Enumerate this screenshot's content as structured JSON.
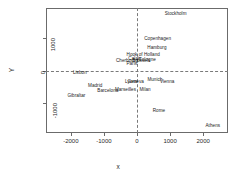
{
  "chart_data": {
    "type": "scatter",
    "title": "",
    "xlabel": "x",
    "ylabel": "Y",
    "xlim": [
      -2750,
      2750
    ],
    "ylim": [
      -1900,
      1900
    ],
    "xticks": [
      -2000,
      -1000,
      0,
      1000,
      2000
    ],
    "xticklabels": [
      "-2000",
      "-1000",
      "0",
      "1000",
      "2000"
    ],
    "yticks": [
      -1000,
      0,
      1000
    ],
    "yticklabels": [
      "-1000",
      "0",
      "1000"
    ],
    "grid": false,
    "legend": null,
    "reference_lines": {
      "h": 0,
      "v": 0,
      "style": "dashed"
    },
    "labels_only": true,
    "points": [
      {
        "label": "Athens",
        "x": 2291,
        "y": -1648
      },
      {
        "label": "Barcelona",
        "x": -881,
        "y": -580
      },
      {
        "label": "Brussels",
        "x": 129,
        "y": 308
      },
      {
        "label": "Calais",
        "x": -64,
        "y": 369
      },
      {
        "label": "Cherbourg",
        "x": -301,
        "y": 306
      },
      {
        "label": "Cologne",
        "x": 306,
        "y": 352
      },
      {
        "label": "Copenhagen",
        "x": 624,
        "y": 1000
      },
      {
        "label": "Geneva",
        "x": -39,
        "y": -323
      },
      {
        "label": "Gibraltar",
        "x": -1831,
        "y": -737
      },
      {
        "label": "Hamburg",
        "x": 601,
        "y": 724
      },
      {
        "label": "Hook of Holland",
        "x": 188,
        "y": 487
      },
      {
        "label": "Lisbon",
        "x": -1727,
        "y": -42
      },
      {
        "label": "Lyons",
        "x": -176,
        "y": -314
      },
      {
        "label": "Madrid",
        "x": -1263,
        "y": -441
      },
      {
        "label": "Marseilles",
        "x": -348,
        "y": -555
      },
      {
        "label": "Milan",
        "x": 245,
        "y": -554
      },
      {
        "label": "Munich",
        "x": 542,
        "y": -254
      },
      {
        "label": "Paris",
        "x": -159,
        "y": 215
      },
      {
        "label": "Rome",
        "x": 662,
        "y": -1186
      },
      {
        "label": "Stockholm",
        "x": 1168,
        "y": 1754
      },
      {
        "label": "Vienna",
        "x": 912,
        "y": -310
      }
    ]
  },
  "axes": {
    "x_title": "x",
    "y_title": "Y"
  }
}
